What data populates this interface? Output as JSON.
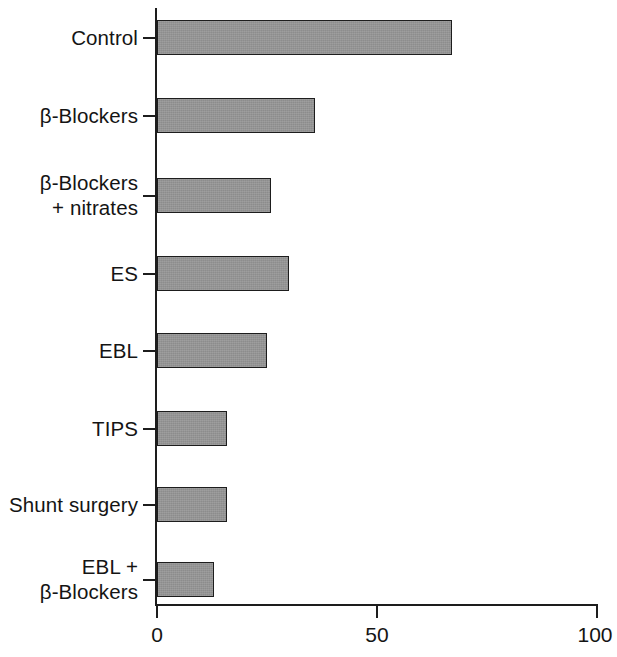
{
  "chart_data": {
    "type": "bar",
    "orientation": "horizontal",
    "title": "",
    "subtitle": "",
    "xlabel": "",
    "ylabel": "",
    "xlim": [
      0,
      100
    ],
    "xticks": [
      0,
      50,
      100
    ],
    "xtick_labels": [
      "0",
      "50",
      "100"
    ],
    "grid": false,
    "legend": null,
    "categories": [
      "Control",
      "β-Blockers",
      "β-Blockers\n+ nitrates",
      "ES",
      "EBL",
      "TIPS",
      "Shunt surgery",
      "EBL +\nβ-Blockers"
    ],
    "values": [
      67,
      36,
      26,
      30,
      25,
      16,
      16,
      13
    ],
    "series": [
      {
        "name": "",
        "values": [
          67,
          36,
          26,
          30,
          25,
          16,
          16,
          13
        ]
      }
    ],
    "bar_fill_color": "#949494",
    "bar_edge_color": "#1d1d1d",
    "axis_color": "#1d1d1d"
  },
  "figure": {
    "background_color": "#ffffff",
    "bars": [
      {
        "label": "Control",
        "value": 67,
        "top": 20,
        "label_top": 32
      },
      {
        "label": "β-Blockers",
        "value": 36,
        "top": 98,
        "label_top": 110
      },
      {
        "label": "β-Blockers",
        "value": 26,
        "top": 178,
        "label_top": 178,
        "label2": "+ nitrates"
      },
      {
        "label": "ES",
        "value": 30,
        "top": 256,
        "label_top": 268
      },
      {
        "label": "EBL",
        "value": 25,
        "top": 333,
        "label_top": 345
      },
      {
        "label": "TIPS",
        "value": 16,
        "top": 411,
        "label_top": 423
      },
      {
        "label": "Shunt surgery",
        "value": 16,
        "top": 487,
        "label_top": 499
      },
      {
        "label": "EBL +",
        "value": 13,
        "top": 562,
        "label_top": 550,
        "label2": "β-Blockers"
      }
    ]
  }
}
